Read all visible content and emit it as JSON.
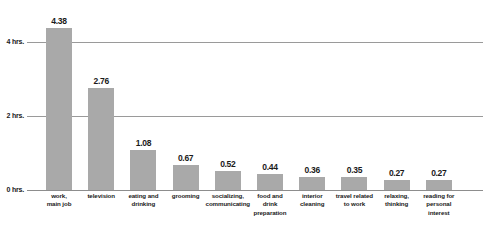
{
  "chart_data": {
    "type": "bar",
    "title": "",
    "subtitle": "",
    "xlabel": "",
    "ylabel": "",
    "ylim": [
      0,
      4.8
    ],
    "grid": true,
    "legend": null,
    "units": "hours",
    "categories": [
      "work,\nmain job",
      "television",
      "eating and\ndrinking",
      "grooming",
      "socializing,\ncommunicating",
      "food and\ndrink\npreparation",
      "interior\ncleaning",
      "travel related\nto work",
      "relaxing,\nthinking",
      "reading for\npersonal\ninterest"
    ],
    "values": [
      4.38,
      2.76,
      1.08,
      0.67,
      0.52,
      0.44,
      0.36,
      0.35,
      0.27,
      0.27
    ],
    "value_labels": [
      "4.38",
      "2.76",
      "1.08",
      "0.67",
      "0.52",
      "0.44",
      "0.36",
      "0.35",
      "0.27",
      "0.27"
    ],
    "yticks": [
      0,
      2,
      4
    ],
    "ytick_labels": [
      "0 hrs.",
      "2 hrs.",
      "4 hrs."
    ],
    "colors": {
      "bar_fill": "#a9a9a9",
      "gridline": "#9a9a9a",
      "text": "#1a1a1a",
      "background": "#ffffff"
    }
  }
}
